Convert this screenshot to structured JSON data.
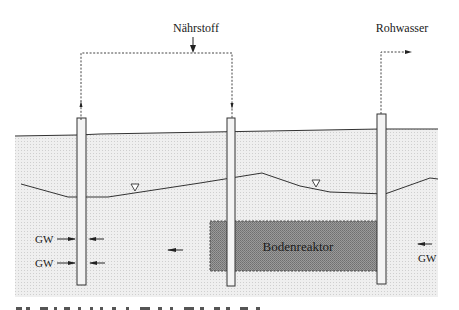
{
  "labels": {
    "nutrient": "Nährstoff",
    "raw_water": "Rohwasser",
    "reactor": "Bodenreaktor",
    "gw_left_upper": "GW",
    "gw_left_lower": "GW",
    "gw_right": "GW"
  },
  "colors": {
    "soil_fill": "#e9e9e9",
    "reactor_fill": "#8a8a8a",
    "line": "#333333",
    "background": "#ffffff"
  },
  "icons": {
    "water_table_marker": "triangle-down",
    "flow_arrow": "arrow-left",
    "pipe_arrow": "arrow-head"
  }
}
